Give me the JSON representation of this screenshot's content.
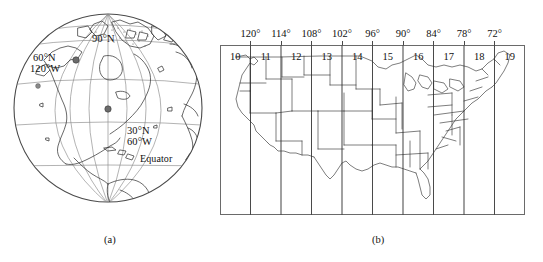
{
  "figure": {
    "caption_a": "(a)",
    "caption_b": "(b)"
  },
  "globe": {
    "name": "orthographic-globe-north-america",
    "labels": {
      "pole": "90°N",
      "lat_60n": "60°N",
      "lon_120w": "120°W",
      "lat_30n": "30°N",
      "lon_60w": "60°W",
      "equator": "Equator"
    },
    "markers": [
      {
        "label": "60°N 120°W"
      },
      {
        "label": "30°N 60°W"
      }
    ],
    "graticule": {
      "parallel_spacing_deg": 30,
      "meridian_spacing_deg": 30
    }
  },
  "zone_map": {
    "title": "UTM zones over the conterminous United States",
    "zone_numbers": [
      "10",
      "11",
      "12",
      "13",
      "14",
      "15",
      "16",
      "17",
      "18",
      "19"
    ],
    "degree_labels": [
      "120°",
      "114°",
      "108°",
      "102°",
      "96°",
      "90°",
      "84°",
      "78°",
      "72°"
    ],
    "zone_width_deg": 6,
    "longitude_range": [
      "126°W",
      "66°W"
    ]
  },
  "colors": {
    "line": "#4a4a4a",
    "border": "#6a6a6a",
    "text": "#111111",
    "background": "#ffffff"
  }
}
